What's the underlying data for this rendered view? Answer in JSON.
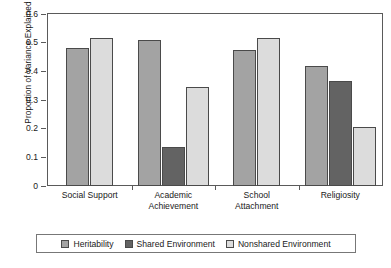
{
  "chart_data": {
    "type": "bar",
    "title": "",
    "subtitle": "",
    "xlabel": "",
    "ylabel": "Proportion of Variance Explained",
    "categories": [
      "Social Support",
      "Academic Achievement",
      "School Attachment",
      "Religiosity"
    ],
    "category_lines": [
      [
        "Social Support"
      ],
      [
        "Academic",
        "Achievement"
      ],
      [
        "School",
        "Attachment"
      ],
      [
        "Religiosity"
      ]
    ],
    "series": [
      {
        "name": "Heritability",
        "color": "#a3a3a3",
        "values": [
          0.48,
          0.508,
          0.475,
          0.417
        ]
      },
      {
        "name": "Shared Environment",
        "color": "#636363",
        "values": [
          0,
          0.135,
          0,
          0.367
        ]
      },
      {
        "name": "Nonshared Environment",
        "color": "#dcdcdc",
        "values": [
          0.515,
          0.345,
          0.515,
          0.205
        ]
      }
    ],
    "ylim": [
      0,
      0.6
    ],
    "ytick_labels": [
      "0.6",
      "0.5",
      "0.4",
      "0.3",
      "0.2",
      "0.1",
      "0"
    ],
    "ytick_values": [
      0.6,
      0.5,
      0.4,
      0.3,
      0.2,
      0.1,
      0
    ],
    "grid": false,
    "legend_position": "bottom",
    "legend_entries": [
      "Heritability",
      "Shared Environment",
      "Nonshared Environment"
    ]
  }
}
